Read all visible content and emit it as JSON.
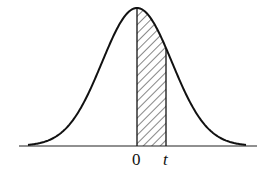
{
  "figure": {
    "labels": {
      "origin": "0",
      "upper_bound": "t"
    },
    "colors": {
      "stroke": "#111111",
      "background": "#ffffff"
    }
  },
  "chart_data": {
    "type": "area",
    "title": "",
    "xlabel": "",
    "ylabel": "",
    "curve": "normal density",
    "shaded_region": {
      "from": "0",
      "to": "t"
    },
    "tick_labels": [
      "0",
      "t"
    ],
    "grid": false,
    "legend": null
  }
}
